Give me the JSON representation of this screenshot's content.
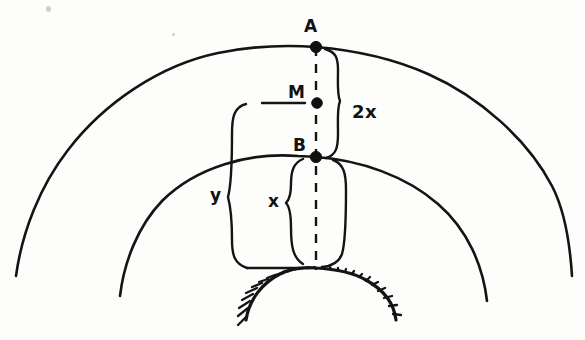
{
  "figure": {
    "kind": "hand-drawn-geometry-sketch",
    "background_color": "#fdfdfb",
    "ink_color": "#141414"
  },
  "points": [
    {
      "id": "A",
      "label": "A",
      "x": 316,
      "y": 47,
      "label_x": 304,
      "label_y": 18
    },
    {
      "id": "M",
      "label": "M",
      "x": 317,
      "y": 103,
      "label_x": 288,
      "label_y": 84
    },
    {
      "id": "B",
      "label": "B",
      "x": 316,
      "y": 157,
      "label_x": 293,
      "label_y": 137
    }
  ],
  "measures": [
    {
      "id": "two-x",
      "label": "2x",
      "label_x": 352,
      "label_y": 103,
      "from": "A",
      "to": "B"
    },
    {
      "id": "x",
      "label": "x",
      "label_x": 268,
      "label_y": 193,
      "from": "B",
      "to": "ground"
    },
    {
      "id": "y",
      "label": "y",
      "label_x": 210,
      "label_y": 187,
      "from": "M",
      "to": "ground"
    }
  ],
  "arcs": [
    {
      "id": "outer-arc",
      "name": "outer-arc",
      "apex_point": "A",
      "left_end_x": 16,
      "left_end_y": 276,
      "right_end_x": 572,
      "right_end_y": 276
    },
    {
      "id": "inner-arc",
      "name": "inner-arc",
      "apex_point": "B",
      "left_end_x": 120,
      "left_end_y": 296,
      "right_end_x": 487,
      "right_end_y": 301
    }
  ],
  "ground": {
    "name": "hatched-ground-surface",
    "hatch_count": 26,
    "apex_x": 316,
    "apex_y": 268
  },
  "axis": {
    "name": "vertical-dashed-axis",
    "x": 316,
    "top_y": 47,
    "bottom_y": 270,
    "style": "dashed"
  }
}
